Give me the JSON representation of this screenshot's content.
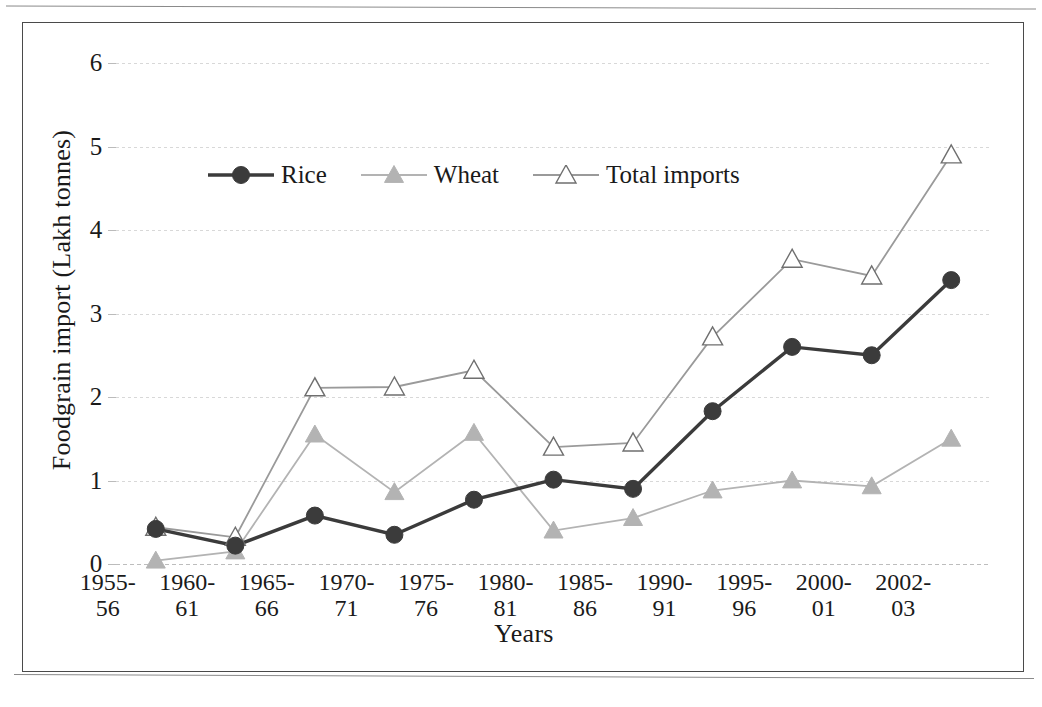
{
  "chart_data": {
    "type": "line",
    "title": "",
    "xlabel": "Years",
    "ylabel": "Foodgrain import (Lakh tonnes)",
    "categories": [
      "1955-56",
      "1960-61",
      "1965-66",
      "1970-71",
      "1975-76",
      "1980-81",
      "1985-86",
      "1990-91",
      "1995-96",
      "2000-01",
      "2002-03"
    ],
    "category_lines": [
      [
        "1955-",
        "56"
      ],
      [
        "1960-",
        "61"
      ],
      [
        "1965-",
        "66"
      ],
      [
        "1970-",
        "71"
      ],
      [
        "1975-",
        "76"
      ],
      [
        "1980-",
        "81"
      ],
      [
        "1985-",
        "86"
      ],
      [
        "1990-",
        "91"
      ],
      [
        "1995-",
        "96"
      ],
      [
        "2000-",
        "01"
      ],
      [
        "2002-",
        "03"
      ]
    ],
    "ylim": [
      0,
      6
    ],
    "yticks": [
      0,
      1,
      2,
      3,
      4,
      5,
      6
    ],
    "ytick_labels": [
      "0",
      "1",
      "2",
      "3",
      "4",
      "5",
      "6"
    ],
    "grid": true,
    "legend_position": "top-left-inside",
    "series": [
      {
        "name": "Rice",
        "marker": "filled-circle",
        "color": "#3b3b3b",
        "values": [
          0.42,
          0.22,
          0.58,
          0.35,
          0.77,
          1.01,
          0.9,
          1.83,
          2.6,
          2.5,
          3.4
        ]
      },
      {
        "name": "Wheat",
        "marker": "filled-triangle",
        "color": "#b3b3b3",
        "values": [
          0.04,
          0.15,
          1.55,
          0.86,
          1.57,
          0.4,
          0.55,
          0.88,
          1.0,
          0.93,
          1.5
        ]
      },
      {
        "name": "Total imports",
        "marker": "open-triangle",
        "color": "#a8a8a8",
        "values": [
          0.44,
          0.32,
          2.11,
          2.12,
          2.32,
          1.4,
          1.45,
          2.72,
          3.65,
          3.45,
          4.9
        ]
      }
    ]
  },
  "legend": {
    "entries": [
      {
        "label": "Rice"
      },
      {
        "label": "Wheat"
      },
      {
        "label": "Total imports"
      }
    ]
  },
  "axes": {
    "y_title": "Foodgrain import (Lakh tonnes)",
    "x_title": "Years"
  }
}
